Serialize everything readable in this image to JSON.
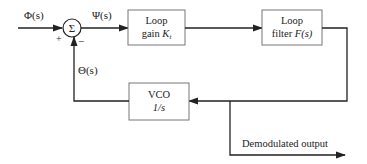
{
  "diagram": {
    "signals": {
      "input": "Φ(s)",
      "error": "Ψ(s)",
      "feedback": "Θ(s)",
      "output": "Demodulated output"
    },
    "summing_junction": {
      "symbol": "Σ",
      "plus_sign": "+",
      "minus_sign": "−"
    },
    "blocks": {
      "loop_gain": {
        "line1": "Loop",
        "line2_text": "gain ",
        "line2_var": "K",
        "line2_sub": "t"
      },
      "loop_filter": {
        "line1": "Loop",
        "line2_text": "filter ",
        "line2_var": "F(s)"
      },
      "vco": {
        "line1": "VCO",
        "line2": "1/s"
      }
    },
    "colors": {
      "line": "#222222",
      "box_border": "#777777",
      "text": "#222222",
      "background": "#ffffff"
    }
  }
}
